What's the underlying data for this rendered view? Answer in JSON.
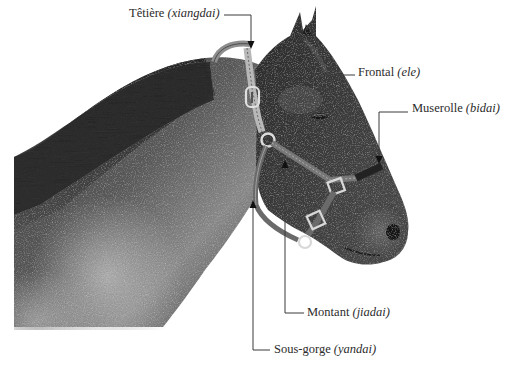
{
  "diagram": {
    "labels": [
      {
        "id": "tetiere",
        "term": "Têtière",
        "pinyin": "(xiangdai)",
        "x": 129,
        "y": 7
      },
      {
        "id": "frontal",
        "term": "Frontal",
        "pinyin": "(ele)",
        "x": 358,
        "y": 66
      },
      {
        "id": "muserolle",
        "term": "Muserolle",
        "pinyin": "(bidai)",
        "x": 412,
        "y": 102
      },
      {
        "id": "montant",
        "term": "Montant",
        "pinyin": "(jiadai)",
        "x": 307,
        "y": 306
      },
      {
        "id": "sousgorge",
        "term": "Sous-gorge",
        "pinyin": "(yandai)",
        "x": 274,
        "y": 343
      }
    ],
    "colors": {
      "background": "#ffffff",
      "text": "#2b2b2b",
      "leader_line": "#3a3a3a"
    }
  }
}
